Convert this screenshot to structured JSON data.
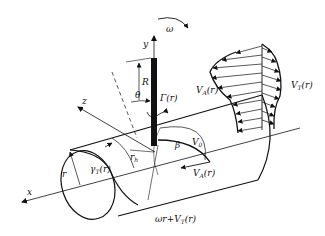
{
  "diagram": {
    "type": "propeller blade / lifting-line cylinder velocity diagram",
    "colors": {
      "stroke": "#111111",
      "background": "#ffffff",
      "blade": "#111111"
    },
    "axes": {
      "x": "x",
      "y": "y",
      "z": "z"
    },
    "labels": {
      "omega": "ω",
      "R": "R",
      "theta": "θ",
      "gamma": "Γ(r)",
      "va_profile": "V",
      "va_profile_sub": "A",
      "va_profile_arg": "(r)",
      "vt_profile": "V",
      "vt_profile_sub": "T",
      "vt_profile_arg": "(r)",
      "v0": "V",
      "v0_sub": "0",
      "rh": "r",
      "rh_sub": "h",
      "beta": "β",
      "r": "r",
      "gamma_t": "γ",
      "gamma_t_sub": "T",
      "gamma_t_arg": "(r)",
      "va_vec": "V",
      "va_vec_sub": "A",
      "va_vec_arg": "(r)",
      "omega_r": "ωr+V",
      "omega_r_sub": "T",
      "omega_r_arg": "(r)"
    }
  }
}
